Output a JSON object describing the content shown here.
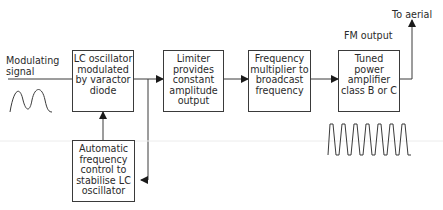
{
  "labels": {
    "modulating_signal": "Modulating\nsignal",
    "fm_output": "FM output",
    "to_aerial": "To aerial"
  },
  "blocks": [
    {
      "id": "lc_oscillator",
      "text": "LC oscillator\nmodulated\nby varactor\ndiode"
    },
    {
      "id": "limiter",
      "text": "Limiter\nprovides\nconstant\namplitude\noutput"
    },
    {
      "id": "frequency_multiplier",
      "text": "Frequency\nmultiplier to\nbroadcast\nfrequency"
    },
    {
      "id": "power_amplifier",
      "text": "Tuned\npower\namplifier\nclass B or C"
    },
    {
      "id": "afc",
      "text": "Automatic\nfrequency\ncontrol to\nstabilise LC\noscillator"
    }
  ],
  "waveforms": [
    {
      "id": "modulating-wave",
      "cycles": 2
    },
    {
      "id": "fm-output-wave",
      "cycles": 7
    }
  ],
  "colors": {
    "line": "#3a3a3a",
    "text": "#2a2a2a",
    "background": "#ffffff"
  }
}
